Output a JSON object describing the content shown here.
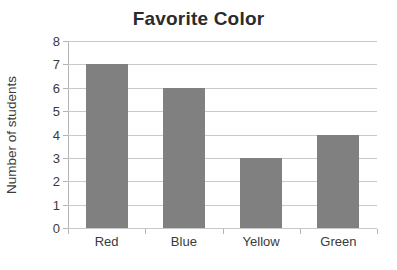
{
  "chart_data": {
    "type": "bar",
    "title": "Favorite Color",
    "xlabel": "",
    "ylabel": "Number of students",
    "categories": [
      "Red",
      "Blue",
      "Yellow",
      "Green"
    ],
    "values": [
      7,
      6,
      3,
      4
    ],
    "ylim": [
      0,
      8
    ],
    "ytick_labels": [
      "8",
      "7",
      "6",
      "5",
      "4",
      "3",
      "2",
      "1",
      "0"
    ],
    "ytick_values": [
      8,
      7,
      6,
      5,
      4,
      3,
      2,
      1,
      0
    ],
    "grid": "horizontal",
    "legend": "none",
    "bar_color": "#808080",
    "gridline_color": "#c9c9c9",
    "axis_color": "#b4b4b4",
    "background_color": "#ffffff",
    "text_color": "#3a3a3a"
  }
}
